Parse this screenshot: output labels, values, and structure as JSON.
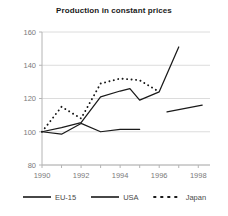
{
  "chart_data": {
    "type": "line",
    "title": "Production in constant prices",
    "xlabel": "",
    "ylabel": "",
    "xlim": [
      1990,
      1998.6
    ],
    "ylim": [
      80,
      160
    ],
    "xticks": [
      1990,
      1992,
      1994,
      1996,
      1998
    ],
    "xtick_labels": [
      "1990",
      "1992",
      "1994",
      "1996",
      "1998"
    ],
    "yticks": [
      80,
      100,
      120,
      140,
      160
    ],
    "ytick_labels": [
      "80",
      "100",
      "120",
      "140",
      "160"
    ],
    "grid": "horizontal",
    "legend_position": "bottom",
    "series": [
      {
        "name": "EU-15",
        "style": "solid",
        "color": "#1a1a1a",
        "x": [
          1990,
          1991,
          1992,
          1993,
          1994,
          1994.5,
          1995,
          1996,
          1997
        ],
        "values": [
          100,
          102.5,
          105.5,
          121,
          124.5,
          126,
          119,
          124,
          151
        ]
      },
      {
        "name": "USA",
        "style": "solid",
        "color": "#1a1a1a",
        "x": [
          1990,
          1991,
          1992,
          1993,
          1994,
          1995
        ],
        "values": [
          100,
          98.5,
          105,
          100,
          101.5,
          101.5
        ]
      },
      {
        "name": "USA",
        "style": "solid",
        "color": "#1a1a1a",
        "segment": "second",
        "x": [
          1996.4,
          1998.2
        ],
        "values": [
          112,
          116
        ]
      },
      {
        "name": "Japan",
        "style": "dotted",
        "color": "#1a1a1a",
        "x": [
          1990,
          1991,
          1992,
          1993,
          1994,
          1995,
          1996
        ],
        "values": [
          100,
          115,
          108,
          129,
          132,
          131,
          124
        ]
      }
    ]
  },
  "legend": {
    "items": [
      {
        "label": "EU-15",
        "style": "solid"
      },
      {
        "label": "USA",
        "style": "solid"
      },
      {
        "label": "Japan",
        "style": "dotted"
      }
    ]
  },
  "colors": {
    "ink": "#1a1a1a",
    "grid": "#dcdcdc",
    "axis": "#b4b4b4",
    "tick_text": "#7a7a7a"
  }
}
